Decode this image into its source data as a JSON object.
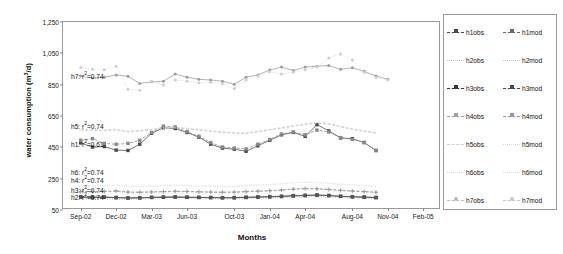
{
  "chart_data": {
    "type": "line",
    "title": "",
    "xlabel": "Months",
    "ylabel": "water consumption (m³/d)",
    "ylabel_parts": {
      "pre": "water consumption (m",
      "sup": "3",
      "post": "/d)"
    },
    "ylim": [
      50,
      1250
    ],
    "yticks": [
      50,
      250,
      450,
      650,
      850,
      1050,
      1250
    ],
    "ytick_labels": [
      "50",
      "250",
      "450",
      "650",
      "850",
      "1,050",
      "1,250"
    ],
    "grid": false,
    "legend_position": "right-outside",
    "xtick_labels": [
      "Sep-02",
      "Dec-02",
      "Mar-03",
      "Jun-03",
      "Oct-03",
      "Jan-04",
      "Apr-04",
      "Aug-04",
      "Nov-04",
      "Feb-05"
    ],
    "xtick_positions": [
      0,
      3,
      6,
      9,
      13,
      16,
      19,
      23,
      26,
      29
    ],
    "x": [
      0,
      1,
      2,
      3,
      4,
      5,
      6,
      7,
      8,
      9,
      10,
      11,
      12,
      13,
      14,
      15,
      16,
      17,
      18,
      19,
      20,
      21,
      22,
      23,
      24,
      25,
      26,
      27,
      28
    ],
    "xlim": [
      -1.5,
      30.5
    ],
    "series": [
      {
        "name": "h1obs",
        "color": "#4a4a4a",
        "marker": "square",
        "dash": "solid",
        "values": [
          478,
          452,
          455,
          432,
          430,
          470,
          540,
          575,
          570,
          545,
          515,
          470,
          445,
          438,
          425,
          460,
          495,
          530,
          545,
          520,
          595,
          555,
          510,
          505,
          480,
          430,
          null,
          null,
          null
        ]
      },
      {
        "name": "h1mod",
        "color": "#8a8a8a",
        "marker": "square",
        "dash": "dash",
        "values": [
          495,
          505,
          475,
          470,
          475,
          495,
          545,
          585,
          580,
          550,
          520,
          480,
          452,
          445,
          440,
          470,
          500,
          535,
          548,
          530,
          560,
          548,
          512,
          500,
          482,
          430,
          null,
          null,
          null
        ]
      },
      {
        "name": "h2obs",
        "color": "#b8b8b8",
        "marker": "none",
        "dash": "dot",
        "values": [
          120,
          120,
          122,
          118,
          118,
          120,
          124,
          126,
          128,
          126,
          124,
          122,
          120,
          120,
          122,
          124,
          126,
          128,
          130,
          132,
          134,
          132,
          128,
          126,
          124,
          122,
          null,
          null,
          null
        ]
      },
      {
        "name": "h2mod",
        "color": "#c8c8c8",
        "marker": "none",
        "dash": "dot",
        "values": [
          125,
          124,
          126,
          122,
          121,
          124,
          128,
          130,
          131,
          129,
          127,
          125,
          123,
          123,
          125,
          127,
          129,
          131,
          133,
          135,
          136,
          134,
          130,
          128,
          126,
          124,
          null,
          null,
          null
        ]
      },
      {
        "name": "h3obs",
        "color": "#3a3a3a",
        "marker": "square",
        "dash": "solid",
        "values": [
          132,
          130,
          131,
          129,
          126,
          127,
          130,
          131,
          132,
          131,
          130,
          129,
          128,
          128,
          130,
          132,
          134,
          136,
          140,
          142,
          145,
          142,
          137,
          134,
          132,
          129,
          null,
          null,
          null
        ]
      },
      {
        "name": "h3mod",
        "color": "#555555",
        "marker": "square",
        "dash": "solid",
        "values": [
          134,
          132,
          133,
          130,
          128,
          129,
          131,
          133,
          134,
          132,
          131,
          130,
          129,
          130,
          132,
          134,
          136,
          138,
          142,
          144,
          146,
          143,
          138,
          135,
          133,
          130,
          null,
          null,
          null
        ]
      },
      {
        "name": "h4obs",
        "color": "#a8a8a8",
        "marker": "plus",
        "dash": "dash",
        "values": [
          168,
          166,
          167,
          170,
          163,
          162,
          164,
          166,
          168,
          167,
          165,
          163,
          162,
          163,
          166,
          169,
          172,
          176,
          182,
          186,
          184,
          180,
          174,
          170,
          166,
          162,
          null,
          null,
          null
        ]
      },
      {
        "name": "h4mod",
        "color": "#9a9a9a",
        "marker": "plus",
        "dash": "dash",
        "values": [
          170,
          168,
          169,
          172,
          165,
          164,
          166,
          168,
          170,
          169,
          167,
          165,
          164,
          165,
          168,
          171,
          174,
          178,
          184,
          188,
          186,
          182,
          176,
          172,
          168,
          164,
          null,
          null,
          null
        ]
      },
      {
        "name": "h5obs",
        "color": "#c0c0c0",
        "marker": "none",
        "dash": "dash",
        "values": [
          560,
          558,
          556,
          562,
          548,
          555,
          562,
          570,
          575,
          568,
          560,
          552,
          545,
          540,
          538,
          548,
          560,
          572,
          585,
          596,
          604,
          598,
          580,
          565,
          552,
          540,
          null,
          null,
          null
        ]
      },
      {
        "name": "h5mod",
        "color": "#cccccc",
        "marker": "none",
        "dash": "dash",
        "values": [
          565,
          562,
          560,
          566,
          552,
          558,
          566,
          574,
          578,
          572,
          564,
          556,
          548,
          544,
          542,
          552,
          564,
          576,
          588,
          600,
          608,
          602,
          584,
          568,
          556,
          544,
          null,
          null,
          null
        ]
      },
      {
        "name": "h6obs",
        "color": "#d4d4d4",
        "marker": "none",
        "dash": "dot",
        "values": [
          205,
          203,
          204,
          206,
          200,
          199,
          201,
          204,
          206,
          205,
          203,
          200,
          198,
          199,
          203,
          207,
          211,
          216,
          222,
          226,
          224,
          219,
          213,
          208,
          204,
          199,
          null,
          null,
          null
        ]
      },
      {
        "name": "h6mod",
        "color": "#dcdcdc",
        "marker": "none",
        "dash": "dot",
        "values": [
          208,
          206,
          207,
          209,
          203,
          202,
          204,
          207,
          209,
          208,
          206,
          203,
          201,
          202,
          206,
          210,
          214,
          219,
          225,
          229,
          227,
          222,
          216,
          211,
          207,
          202,
          null,
          null,
          null
        ]
      },
      {
        "name": "h7obs",
        "color": "#9e9e9e",
        "marker": "circle",
        "dash": "solid",
        "values": [
          905,
          893,
          898,
          912,
          903,
          858,
          868,
          872,
          918,
          898,
          884,
          880,
          872,
          852,
          898,
          912,
          944,
          962,
          940,
          962,
          968,
          972,
          948,
          958,
          935,
          905,
          885,
          null,
          null
        ]
      },
      {
        "name": "h7mod",
        "color": "#cfcfcf",
        "marker": "circle",
        "dash": "dot",
        "values": [
          960,
          948,
          945,
          968,
          820,
          815,
          872,
          848,
          880,
          872,
          862,
          865,
          858,
          826,
          880,
          905,
          932,
          918,
          930,
          945,
          962,
          1020,
          1046,
          1008,
          930,
          895,
          880,
          null,
          null
        ]
      }
    ],
    "annotations": [
      {
        "id": "h7",
        "text": "h7: r²=0.74",
        "label_pre": "h7: r",
        "label_sup": "2",
        "label_post": "=0.74",
        "y": 912,
        "x_px": 8
      },
      {
        "id": "h5",
        "text": "h5: r²=0.74",
        "label_pre": "h5: r",
        "label_sup": "2",
        "label_post": "=0.74",
        "y": 595,
        "x_px": 8
      },
      {
        "id": "h1",
        "text": "h1: r²=0.61",
        "label_pre": "h1: r",
        "label_sup": "2",
        "label_post": "=0.61",
        "y": 475,
        "x_px": 8
      },
      {
        "id": "h6",
        "text": "h6: r²=0.74",
        "label_pre": "h6: r",
        "label_sup": "2",
        "label_post": "=0.74",
        "y": 300,
        "x_px": 8
      },
      {
        "id": "h4",
        "text": "h4: r²=0.74",
        "label_pre": "h4: r",
        "label_sup": "2",
        "label_post": "=0.74",
        "y": 246,
        "x_px": 8
      },
      {
        "id": "h3",
        "text": "h3: r²=0.74",
        "label_pre": "h3: r",
        "label_sup": "2",
        "label_post": "=0.74",
        "y": 182,
        "x_px": 8
      },
      {
        "id": "h2",
        "text": "h2: r²=0.74",
        "label_pre": "h2: r",
        "label_sup": "2",
        "label_post": "=0.74",
        "y": 140,
        "x_px": 8
      }
    ]
  },
  "legend": {
    "rows": [
      {
        "obs": {
          "label": "h1obs",
          "color": "#4a4a4a",
          "marker": "square",
          "dash": "dash"
        },
        "mod": {
          "label": "h1mod",
          "color": "#6a6a6a",
          "marker": "square",
          "dash": "dash"
        }
      },
      {
        "obs": {
          "label": "h2obs",
          "color": "#c4c4c4",
          "marker": "none",
          "dash": "dot"
        },
        "mod": {
          "label": "h2mod",
          "color": "#cccccc",
          "marker": "none",
          "dash": "dot"
        }
      },
      {
        "obs": {
          "label": "h3obs",
          "color": "#3a3a3a",
          "marker": "square",
          "dash": "dash"
        },
        "mod": {
          "label": "h3mod",
          "color": "#4a4a4a",
          "marker": "square",
          "dash": "dash"
        }
      },
      {
        "obs": {
          "label": "h4obs",
          "color": "#a0a0a0",
          "marker": "plus",
          "dash": "dash"
        },
        "mod": {
          "label": "h4mod",
          "color": "#999999",
          "marker": "square",
          "dash": "dash"
        }
      },
      {
        "obs": {
          "label": "h5obs",
          "color": "#d0d0d0",
          "marker": "none",
          "dash": "dash"
        },
        "mod": {
          "label": "h5mod",
          "color": "#d8d8d8",
          "marker": "none",
          "dash": "dot"
        }
      },
      {
        "obs": {
          "label": "h6obs",
          "color": "#d8d8d8",
          "marker": "none",
          "dash": "dot"
        },
        "mod": {
          "label": "h6mod",
          "color": "#dedede",
          "marker": "none",
          "dash": "dot"
        }
      },
      {
        "obs": {
          "label": "h7obs",
          "color": "#bdbdbd",
          "marker": "circle",
          "dash": "dash"
        },
        "mod": {
          "label": "h7mod",
          "color": "#c8c8c8",
          "marker": "circle",
          "dash": "dash"
        }
      }
    ]
  }
}
